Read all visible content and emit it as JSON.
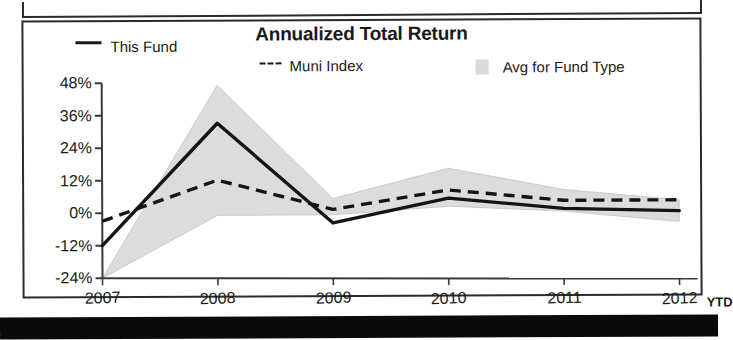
{
  "chart_data": {
    "type": "line",
    "title": "Annualized Total Return",
    "xlabel": "",
    "ylabel": "",
    "grid": false,
    "legend_position": "top",
    "categories": [
      "2007",
      "2008",
      "2009",
      "2010",
      "2011",
      "2012"
    ],
    "x_tick_suffix": "YTD",
    "ylim": [
      -24,
      48
    ],
    "y_ticks": [
      48,
      36,
      24,
      12,
      0,
      -12,
      -24
    ],
    "y_tick_labels": [
      "48%",
      "36%",
      "24%",
      "12%",
      "0%",
      "-12%",
      "-24%"
    ],
    "series": [
      {
        "name": "This Fund",
        "style": "solid",
        "color": "#1a1a1a",
        "values": [
          -12,
          33,
          -4,
          5,
          1,
          0
        ]
      },
      {
        "name": "Muni Index",
        "style": "dashed",
        "color": "#1a1a1a",
        "values": [
          -3,
          12,
          1,
          8,
          4,
          4
        ]
      },
      {
        "name": "Avg for Fund Type",
        "style": "band",
        "color": "#d9d9d9",
        "upper": [
          -24,
          47,
          5,
          16,
          8,
          4
        ],
        "lower": [
          -24,
          -1,
          -1,
          2,
          0,
          -4
        ]
      }
    ]
  },
  "chart": {
    "title": "Annualized Total Return",
    "legend": [
      {
        "label": "This Fund",
        "marker": "solid-line"
      },
      {
        "label": "Muni Index",
        "marker": "dashed-line"
      },
      {
        "label": "Avg for Fund Type",
        "marker": "gray-swatch"
      }
    ],
    "y_axis": {
      "labels": [
        "48%",
        "36%",
        "24%",
        "12%",
        "0%",
        "-12%",
        "-24%"
      ]
    },
    "x_axis": {
      "labels": [
        "2007",
        "2008",
        "2009",
        "2010",
        "2011",
        "2012"
      ],
      "suffix": "YTD"
    },
    "colors": {
      "line": "#1a1a1a",
      "band": "#d9d9d9",
      "frame": "#2b2b2b",
      "background": "#ffffff"
    }
  }
}
